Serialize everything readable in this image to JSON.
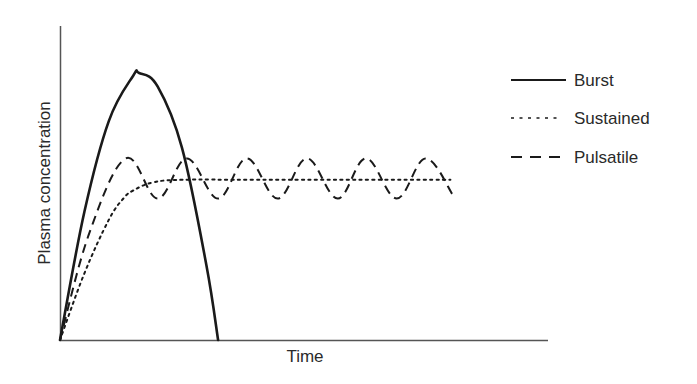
{
  "chart_data": {
    "type": "line",
    "title": "",
    "xlabel": "Time",
    "ylabel": "Plasma concentration",
    "grid": false,
    "legend_position": "right",
    "x_ticks": [],
    "y_ticks": [],
    "xlim": [
      0,
      100
    ],
    "ylim": [
      0,
      100
    ],
    "series": [
      {
        "name": "Burst",
        "style": "solid",
        "x": [
          0,
          5,
          10,
          15,
          16.2,
          20,
          25,
          30,
          32.4
        ],
        "y": [
          0,
          48,
          82,
          99,
          100,
          95,
          72,
          28,
          0
        ]
      },
      {
        "name": "Sustained",
        "style": "dotted",
        "x": [
          0,
          5,
          10,
          13,
          15,
          19,
          25,
          40,
          60,
          80
        ],
        "y": [
          0,
          25,
          45,
          53,
          56,
          59,
          60,
          60,
          60,
          60
        ]
      },
      {
        "name": "Pulsatile",
        "style": "dashed",
        "x": [
          0,
          6,
          13.5,
          20,
          26,
          32.4,
          38.3,
          44.6,
          50.6,
          56.9,
          62.7,
          69,
          74.9,
          80.6
        ],
        "y": [
          0,
          40,
          68,
          53,
          68,
          53,
          68,
          53,
          68,
          53,
          68,
          53,
          68,
          54
        ]
      }
    ],
    "annotations": []
  },
  "legend": {
    "items": [
      {
        "label": "Burst",
        "style": "solid"
      },
      {
        "label": "Sustained",
        "style": "dotted"
      },
      {
        "label": "Pulsatile",
        "style": "dashed"
      }
    ]
  },
  "axes": {
    "xlabel": "Time",
    "ylabel": "Plasma concentration"
  },
  "colors": {
    "line": "#1a1a1a",
    "axis": "#555555",
    "text": "#2a2a2a"
  }
}
